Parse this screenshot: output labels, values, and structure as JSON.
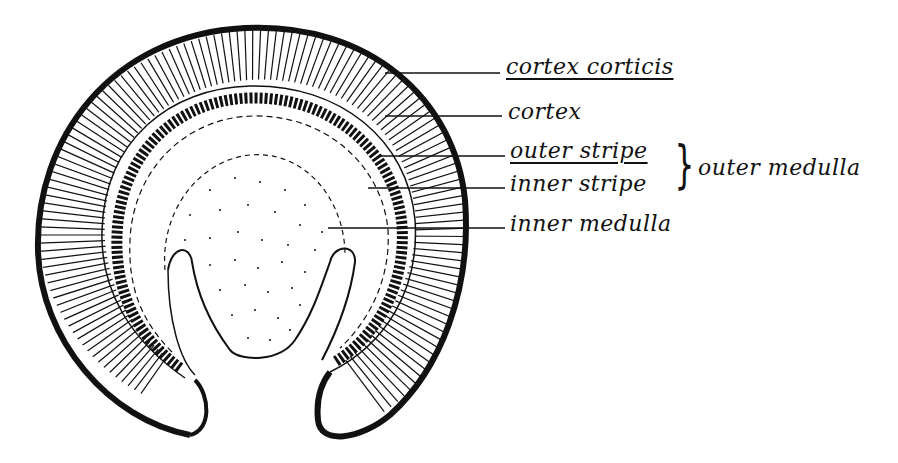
{
  "diagram": {
    "labels": {
      "cortex_corticis": "cortex corticis",
      "cortex": "cortex",
      "outer_stripe": "outer stripe",
      "inner_stripe": "inner stripe",
      "outer_medulla": "outer medulla",
      "inner_medulla": "inner medulla"
    },
    "colors": {
      "ink": "#111111",
      "paper": "#ffffff"
    }
  }
}
